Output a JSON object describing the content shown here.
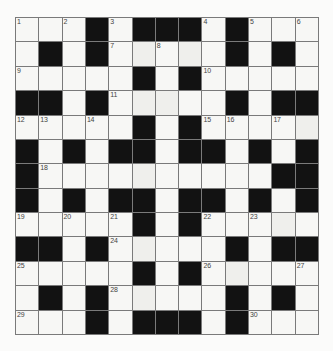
{
  "puzzle": {
    "rows": 13,
    "cols": 13,
    "grid": [
      "...#.###.#...",
      ".#.#.....#.#.",
      ".....#.#.....",
      "##.#.....#.##",
      ".....#.#.....",
      "#.#.##.##.#.#",
      "#..........##",
      "#.#.##.##.#.#",
      ".....#.#.....",
      "##.#.....#.##",
      ".....#.#.....",
      ".#.#.....#.#.",
      "...#.###.#..."
    ],
    "numbers": [
      {
        "r": 0,
        "c": 0,
        "n": "1"
      },
      {
        "r": 0,
        "c": 2,
        "n": "2"
      },
      {
        "r": 0,
        "c": 4,
        "n": "3"
      },
      {
        "r": 0,
        "c": 8,
        "n": "4"
      },
      {
        "r": 0,
        "c": 10,
        "n": "5"
      },
      {
        "r": 0,
        "c": 12,
        "n": "6"
      },
      {
        "r": 1,
        "c": 4,
        "n": "7"
      },
      {
        "r": 1,
        "c": 6,
        "n": "8"
      },
      {
        "r": 2,
        "c": 0,
        "n": "9"
      },
      {
        "r": 2,
        "c": 8,
        "n": "10"
      },
      {
        "r": 3,
        "c": 4,
        "n": "11"
      },
      {
        "r": 4,
        "c": 0,
        "n": "12"
      },
      {
        "r": 4,
        "c": 1,
        "n": "13"
      },
      {
        "r": 4,
        "c": 3,
        "n": "14"
      },
      {
        "r": 4,
        "c": 8,
        "n": "15"
      },
      {
        "r": 4,
        "c": 9,
        "n": "16"
      },
      {
        "r": 4,
        "c": 11,
        "n": "17"
      },
      {
        "r": 6,
        "c": 1,
        "n": "18"
      },
      {
        "r": 8,
        "c": 0,
        "n": "19"
      },
      {
        "r": 8,
        "c": 2,
        "n": "20"
      },
      {
        "r": 8,
        "c": 4,
        "n": "21"
      },
      {
        "r": 8,
        "c": 8,
        "n": "22"
      },
      {
        "r": 8,
        "c": 10,
        "n": "23"
      },
      {
        "r": 9,
        "c": 4,
        "n": "24"
      },
      {
        "r": 10,
        "c": 0,
        "n": "25"
      },
      {
        "r": 10,
        "c": 8,
        "n": "26"
      },
      {
        "r": 10,
        "c": 12,
        "n": "27"
      },
      {
        "r": 11,
        "c": 4,
        "n": "28"
      },
      {
        "r": 12,
        "c": 0,
        "n": "29"
      },
      {
        "r": 12,
        "c": 10,
        "n": "30"
      }
    ],
    "colors": {
      "black_cell": "#121212",
      "white_cell": "#f7f7f5",
      "grid_line": "#7a7a7a",
      "number_text": "#444444"
    }
  }
}
